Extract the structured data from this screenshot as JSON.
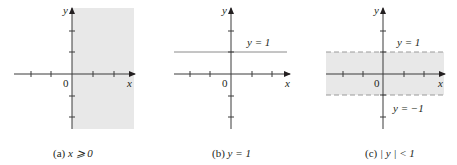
{
  "colors": {
    "axis": "#3a3a3a",
    "shade": "#e8e8e8",
    "line": "#8a8a8a",
    "dash": "#9a9a9a",
    "text": "#231f20"
  },
  "panels": [
    {
      "id": "a",
      "caption_prefix": "(a) ",
      "caption_math": "x ⩾ 0",
      "origin_label": "0",
      "x_axis_label": "x",
      "y_axis_label": "y",
      "region": "x >= 0"
    },
    {
      "id": "b",
      "caption_prefix": "(b) ",
      "caption_math": "y = 1",
      "origin_label": "0",
      "x_axis_label": "x",
      "y_axis_label": "y",
      "line_label": "y = 1",
      "region": "y = 1"
    },
    {
      "id": "c",
      "caption_prefix": "(c) ",
      "caption_math": "| y | < 1",
      "origin_label": "0",
      "x_axis_label": "x",
      "y_axis_label": "y",
      "upper_label": "y = 1",
      "lower_label": "y = −1",
      "region": "|y| < 1"
    }
  ]
}
